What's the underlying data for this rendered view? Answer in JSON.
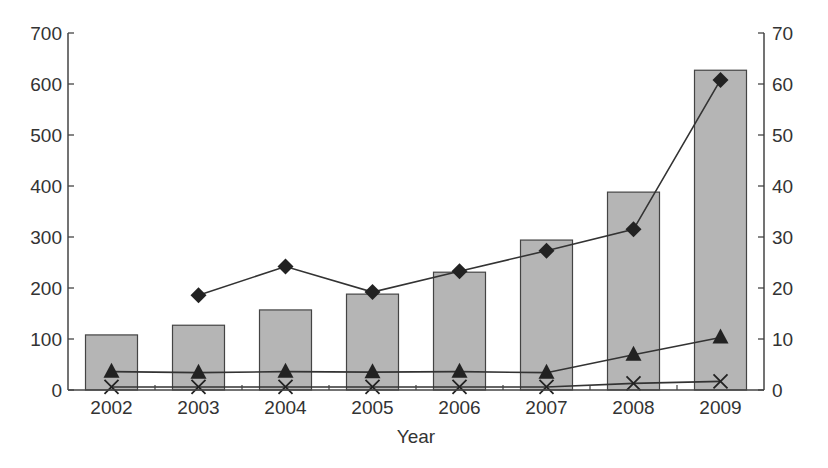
{
  "chart_data": {
    "type": "bar",
    "title": "",
    "xlabel": "Year",
    "ylabel": "",
    "ylabel_right": "",
    "categories": [
      "2002",
      "2003",
      "2004",
      "2005",
      "2006",
      "2007",
      "2008",
      "2009"
    ],
    "ylim": [
      0,
      700
    ],
    "ylim_right": [
      0,
      70
    ],
    "yticks": [
      0,
      100,
      200,
      300,
      400,
      500,
      600,
      700
    ],
    "yticks_right": [
      0,
      10,
      20,
      30,
      40,
      50,
      60,
      70
    ],
    "grid": false,
    "legend": null,
    "series": [
      {
        "name": "bars",
        "type": "bar",
        "axis": "left",
        "color": "#b5b5b5",
        "values": [
          108,
          127,
          157,
          188,
          231,
          294,
          388,
          627
        ]
      },
      {
        "name": "diamond-series",
        "type": "line",
        "axis": "right",
        "marker": "diamond",
        "values": [
          null,
          18.6,
          24.2,
          19.2,
          23.3,
          27.3,
          31.5,
          60.8
        ]
      },
      {
        "name": "triangle-series",
        "type": "line",
        "axis": "right",
        "marker": "triangle",
        "values": [
          3.6,
          3.4,
          3.6,
          3.5,
          3.6,
          3.4,
          6.9,
          10.3
        ]
      },
      {
        "name": "cross-series",
        "type": "line",
        "axis": "right",
        "marker": "x",
        "values": [
          0.6,
          0.6,
          0.6,
          0.6,
          0.6,
          0.6,
          1.3,
          1.7
        ]
      }
    ]
  }
}
